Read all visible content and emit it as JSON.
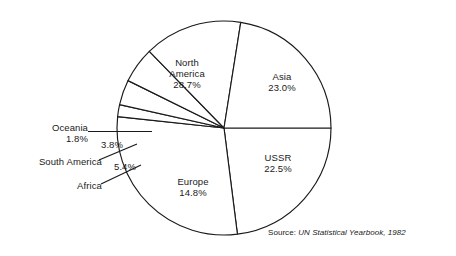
{
  "figure": {
    "background": "#ffffff",
    "ink_color": "#1a1a1a"
  },
  "source": {
    "prefix": "Source: ",
    "title": "UN Statistical Yearbook, 1982"
  },
  "labels": {
    "north_america": {
      "name": "North",
      "name2": "America",
      "pct": "28.7%"
    },
    "asia": {
      "name": "Asia",
      "pct": "23.0%"
    },
    "ussr": {
      "name": "USSR",
      "pct": "22.5%"
    },
    "europe": {
      "name": "Europe",
      "pct": "14.8%"
    },
    "oceania": {
      "name": "Oceania",
      "pct": "1.8%"
    },
    "south_america": {
      "name": "South America",
      "pct": "3.8%"
    },
    "africa": {
      "name": "Africa",
      "pct": "5.4%"
    }
  },
  "chart_data": {
    "type": "pie",
    "title": "",
    "subtitle": "",
    "xlabel": "",
    "ylabel": "",
    "legend_position": "none",
    "grid": false,
    "labels_shown_inside": [
      "North America",
      "Asia",
      "USSR",
      "Europe"
    ],
    "labels_shown_as_callout": [
      "Oceania",
      "South America",
      "Africa"
    ],
    "units": "percent of world total",
    "center": {
      "x": 224,
      "y": 128
    },
    "radius": 107,
    "start_angle_deg": 0,
    "direction": "clockwise",
    "categories": [
      "Asia",
      "North America",
      "Oceania",
      "South America",
      "Africa",
      "Europe",
      "USSR"
    ],
    "values": [
      23.0,
      28.7,
      1.8,
      3.8,
      5.4,
      14.8,
      22.5
    ],
    "slices": [
      {
        "label": "Asia",
        "value": 23.0,
        "display": "23.0%"
      },
      {
        "label": "North America",
        "value": 28.7,
        "display": "28.7%"
      },
      {
        "label": "Oceania",
        "value": 1.8,
        "display": "1.8%"
      },
      {
        "label": "South America",
        "value": 3.8,
        "display": "3.8%"
      },
      {
        "label": "Africa",
        "value": 5.4,
        "display": "5.4%"
      },
      {
        "label": "Europe",
        "value": 14.8,
        "display": "14.8%"
      },
      {
        "label": "USSR",
        "value": 22.5,
        "display": "22.5%"
      }
    ]
  }
}
